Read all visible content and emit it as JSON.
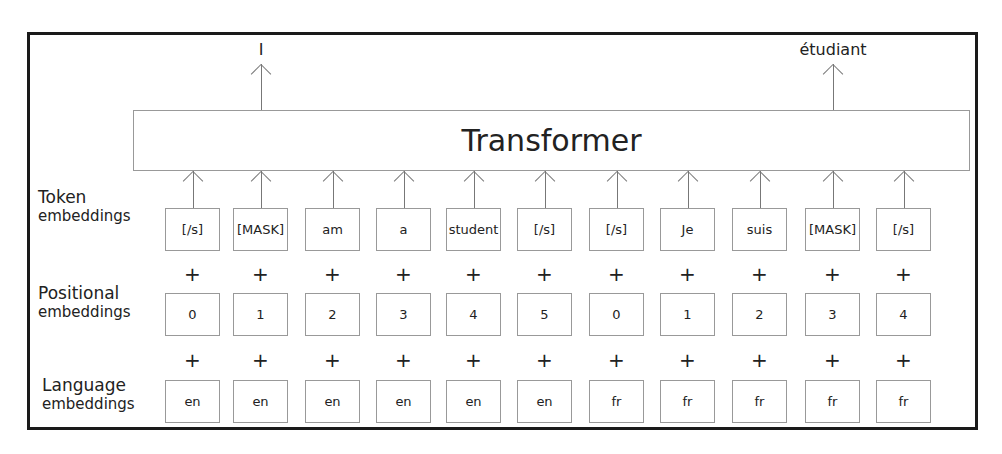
{
  "diagram": {
    "title": "Transformer",
    "outputs": [
      {
        "label": "I",
        "column": 1
      },
      {
        "label": "étudiant",
        "column": 9
      }
    ],
    "rows": {
      "token": {
        "label_line1": "Token",
        "label_line2": "embeddings",
        "values": [
          "[/s]",
          "[MASK]",
          "am",
          "a",
          "student",
          "[/s]",
          "[/s]",
          "Je",
          "suis",
          "[MASK]",
          "[/s]"
        ]
      },
      "positional": {
        "label_line1": "Positional",
        "label_line2": "embeddings",
        "values": [
          "0",
          "1",
          "2",
          "3",
          "4",
          "5",
          "0",
          "1",
          "2",
          "3",
          "4"
        ]
      },
      "language": {
        "label_line1": "Language",
        "label_line2": "embeddings",
        "values": [
          "en",
          "en",
          "en",
          "en",
          "en",
          "en",
          "fr",
          "fr",
          "fr",
          "fr",
          "fr"
        ]
      }
    },
    "operator": "+"
  }
}
